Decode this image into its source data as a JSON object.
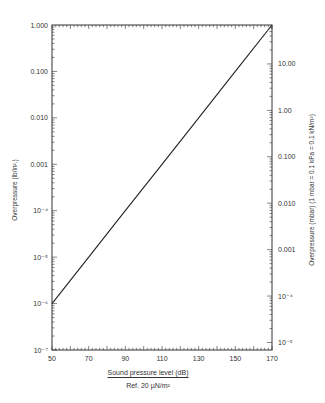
{
  "chart_data": {
    "type": "line",
    "title": "",
    "xlabel": "Sound pressure level (dB)",
    "xlabel_sub": "Ref. 20 µN/m²",
    "ylabel": "Overpressure (lb/in².)",
    "ylabel_right": "Overpressure (mbar) (1 mbar = 0.1 kPa = 0.1 kN/m²)",
    "xlim": [
      50,
      170
    ],
    "ylim": [
      1e-07,
      1.0
    ],
    "yscale": "log",
    "grid": false,
    "x_ticks": [
      "50",
      "70",
      "90",
      "110",
      "130",
      "150",
      "170"
    ],
    "y_ticks_left": [
      "1.000",
      "0.100",
      "0.010",
      "0.001",
      "10⁻⁴",
      "10⁻⁵",
      "10⁻⁶",
      "10⁻⁷"
    ],
    "y_ticks_right": [
      "10.00",
      "1.00",
      "0.100",
      "0.010",
      "0.001",
      "10⁻⁴",
      "10⁻⁵"
    ],
    "series": [
      {
        "name": "Overpressure vs SPL",
        "x": [
          50,
          70,
          90,
          110,
          130,
          150,
          170
        ],
        "values": [
          1e-06,
          1e-05,
          0.0001,
          0.001,
          0.01,
          0.1,
          1.0
        ]
      }
    ]
  },
  "labels": {
    "x_title": "Sound pressure level (dB)",
    "x_sub": "Ref. 20 µN/m²",
    "y_left": "Overpressure (lb/in².)",
    "y_right": "Overpressure (mbar) (1 mbar = 0.1 kPa = 0.1 kN/m²)"
  },
  "colors": {
    "line": "#222222",
    "axis": "#333333"
  }
}
